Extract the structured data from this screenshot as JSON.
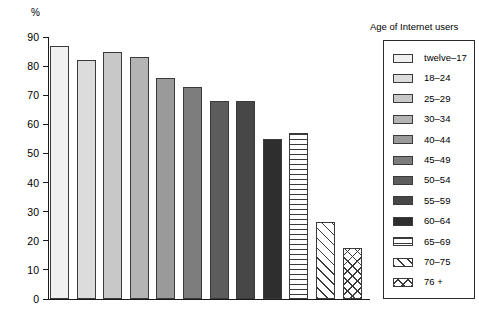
{
  "chart_data": {
    "type": "bar",
    "title": "",
    "xlabel": "",
    "ylabel": "%",
    "ylim": [
      0,
      90
    ],
    "ytick_step": 10,
    "yticks": [
      0,
      10,
      20,
      30,
      40,
      50,
      60,
      70,
      80,
      90
    ],
    "grid": false,
    "legend_position": "right",
    "legend_title": "Age of Internet users",
    "categories": [
      "twelve–17",
      "18–24",
      "25–29",
      "30–34",
      "40–44",
      "45–49",
      "50–54",
      "55–59",
      "60–64",
      "65–69",
      "70–75",
      "76 +"
    ],
    "values": [
      87,
      82,
      85,
      83,
      76,
      73,
      68,
      68,
      55,
      57,
      26.5,
      17.5
    ],
    "bar_styles": [
      {
        "fill": "#f0f0f0",
        "pattern": "solid"
      },
      {
        "fill": "#dcdcdc",
        "pattern": "solid"
      },
      {
        "fill": "#c8c8c8",
        "pattern": "solid"
      },
      {
        "fill": "#b4b4b4",
        "pattern": "solid"
      },
      {
        "fill": "#9a9a9a",
        "pattern": "solid"
      },
      {
        "fill": "#7d7d7d",
        "pattern": "solid"
      },
      {
        "fill": "#5c5c5c",
        "pattern": "solid"
      },
      {
        "fill": "#474747",
        "pattern": "solid"
      },
      {
        "fill": "#2e2e2e",
        "pattern": "solid"
      },
      {
        "fill": "#ffffff",
        "pattern": "horizontal"
      },
      {
        "fill": "#ffffff",
        "pattern": "diagonal"
      },
      {
        "fill": "#ffffff",
        "pattern": "cross"
      }
    ]
  },
  "axis": {
    "unit_label": "%"
  }
}
